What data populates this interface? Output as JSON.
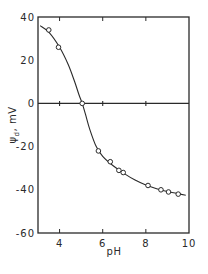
{
  "chart_data": {
    "type": "scatter",
    "title": "",
    "xlabel": "pH",
    "ylabel": "ψd , mV",
    "ylabel_main": "ψ",
    "ylabel_sub": "d",
    "ylabel_unit": ", mV",
    "xlim": [
      3,
      10
    ],
    "ylim": [
      -60,
      40
    ],
    "xticks": [
      4,
      6,
      8,
      10
    ],
    "xtick_labels": [
      "4",
      "6",
      "8",
      "10"
    ],
    "yticks": [
      40,
      20,
      0,
      -20,
      -40,
      -60
    ],
    "ytick_labels": [
      "40",
      "20",
      "0",
      "-20",
      "-40",
      "-60"
    ],
    "grid": false,
    "legend": null,
    "reference_line": {
      "y": 0,
      "ticks_at_x": [
        4,
        6,
        8
      ]
    },
    "series": [
      {
        "name": "measured",
        "marker": "open-circle",
        "x": [
          3.5,
          3.95,
          5.05,
          5.8,
          6.35,
          6.75,
          6.95,
          8.1,
          8.7,
          9.05,
          9.5
        ],
        "y": [
          34,
          26,
          0,
          -22,
          -27,
          -31,
          -32,
          -38,
          -40,
          -41,
          -42
        ]
      },
      {
        "name": "fitted curve",
        "marker": "line",
        "x": [
          3.1,
          3.5,
          4.0,
          4.4,
          4.7,
          4.9,
          5.05,
          5.2,
          5.4,
          5.7,
          6.0,
          6.5,
          7.0,
          7.5,
          8.0,
          8.5,
          9.0,
          9.5,
          9.85
        ],
        "y": [
          36,
          33,
          26,
          18,
          10,
          4,
          0,
          -5,
          -12,
          -20,
          -24.5,
          -29,
          -32.5,
          -35.5,
          -37.8,
          -39.5,
          -40.8,
          -41.8,
          -42.5
        ]
      }
    ]
  },
  "colors": {
    "ink": "#2a2a2a",
    "background": "#ffffff"
  }
}
